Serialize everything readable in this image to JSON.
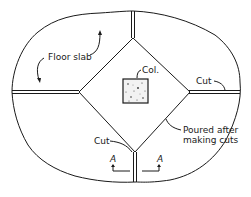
{
  "diagram": {
    "type": "construction-joint-plan",
    "labels": {
      "floor_slab": "Floor slab",
      "column": "Col.",
      "cut_top_right": "Cut",
      "cut_bottom_left": "Cut",
      "poured_line1": "Poured after",
      "poured_line2": "making cuts",
      "section_left": "A",
      "section_right": "A"
    },
    "colors": {
      "line": "#1a1a1a",
      "background": "#ffffff",
      "column_fill": "#f2f2f2"
    }
  }
}
